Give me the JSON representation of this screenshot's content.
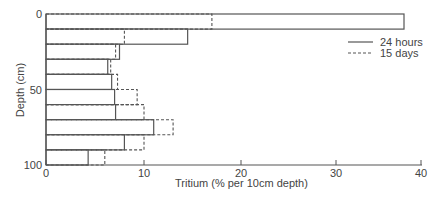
{
  "chart_data": {
    "type": "bar",
    "orientation": "horizontal",
    "title": "",
    "xlabel": "Tritium (% per 10cm depth)",
    "ylabel": "Depth (cm)",
    "xlim": [
      0,
      40
    ],
    "ylim": [
      0,
      100
    ],
    "x_ticks": [
      "0",
      "10",
      "20",
      "30",
      "40"
    ],
    "y_ticks": [
      "0",
      "50",
      "100"
    ],
    "categories": [
      "0-10",
      "10-20",
      "20-30",
      "30-40",
      "40-50",
      "50-60",
      "60-70",
      "70-80",
      "80-90",
      "90-100"
    ],
    "series": [
      {
        "name": "24 hours",
        "style": "solid",
        "values": [
          38,
          14.5,
          7.5,
          6.3,
          6.7,
          7.0,
          7.1,
          11.0,
          8.0,
          4.3
        ]
      },
      {
        "name": "15 days",
        "style": "dashed",
        "values": [
          17,
          8.0,
          7.1,
          6.6,
          7.3,
          9.3,
          10.0,
          13.0,
          10.0,
          6.0
        ]
      }
    ],
    "grid": false,
    "legend_position": "upper right"
  },
  "legend": {
    "items": [
      {
        "label": "24 hours",
        "style": "solid"
      },
      {
        "label": "15 days",
        "style": "dashed"
      }
    ]
  },
  "colors": {
    "line": "#555555",
    "text": "#444444"
  }
}
